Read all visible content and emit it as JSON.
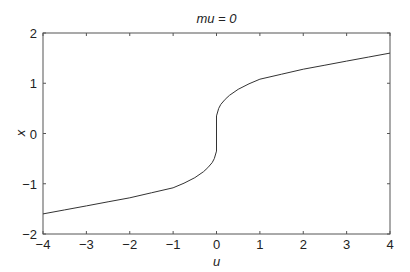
{
  "chart_data": {
    "type": "line",
    "title": "mu = 0",
    "xlabel": "u",
    "ylabel": "x",
    "xlim": [
      -4,
      4
    ],
    "ylim": [
      -2,
      2
    ],
    "xticks": [
      -4,
      -3,
      -2,
      -1,
      0,
      1,
      2,
      3,
      4
    ],
    "yticks": [
      -2,
      -1,
      0,
      1,
      2
    ],
    "xtick_labels": [
      "−4",
      "−3",
      "−2",
      "−1",
      "0",
      "1",
      "2",
      "3",
      "4"
    ],
    "ytick_labels": [
      "−2",
      "−1",
      "0",
      "1",
      "2"
    ],
    "grid": false,
    "legend": null,
    "series": [
      {
        "name": "x(u)",
        "color": "#333333",
        "x": [
          -4,
          -3.5,
          -3,
          -2.5,
          -2,
          -1.5,
          -1,
          -0.75,
          -0.5,
          -0.3,
          -0.2,
          -0.1,
          -0.05,
          0,
          0,
          0.05,
          0.1,
          0.2,
          0.3,
          0.5,
          0.75,
          1,
          1.5,
          2,
          2.5,
          3,
          3.5,
          4
        ],
        "y": [
          -1.6,
          -1.52,
          -1.44,
          -1.36,
          -1.28,
          -1.18,
          -1.08,
          -0.99,
          -0.88,
          -0.76,
          -0.68,
          -0.58,
          -0.5,
          -0.35,
          0.35,
          0.5,
          0.58,
          0.68,
          0.76,
          0.88,
          0.99,
          1.08,
          1.18,
          1.28,
          1.36,
          1.44,
          1.52,
          1.6
        ]
      }
    ]
  }
}
